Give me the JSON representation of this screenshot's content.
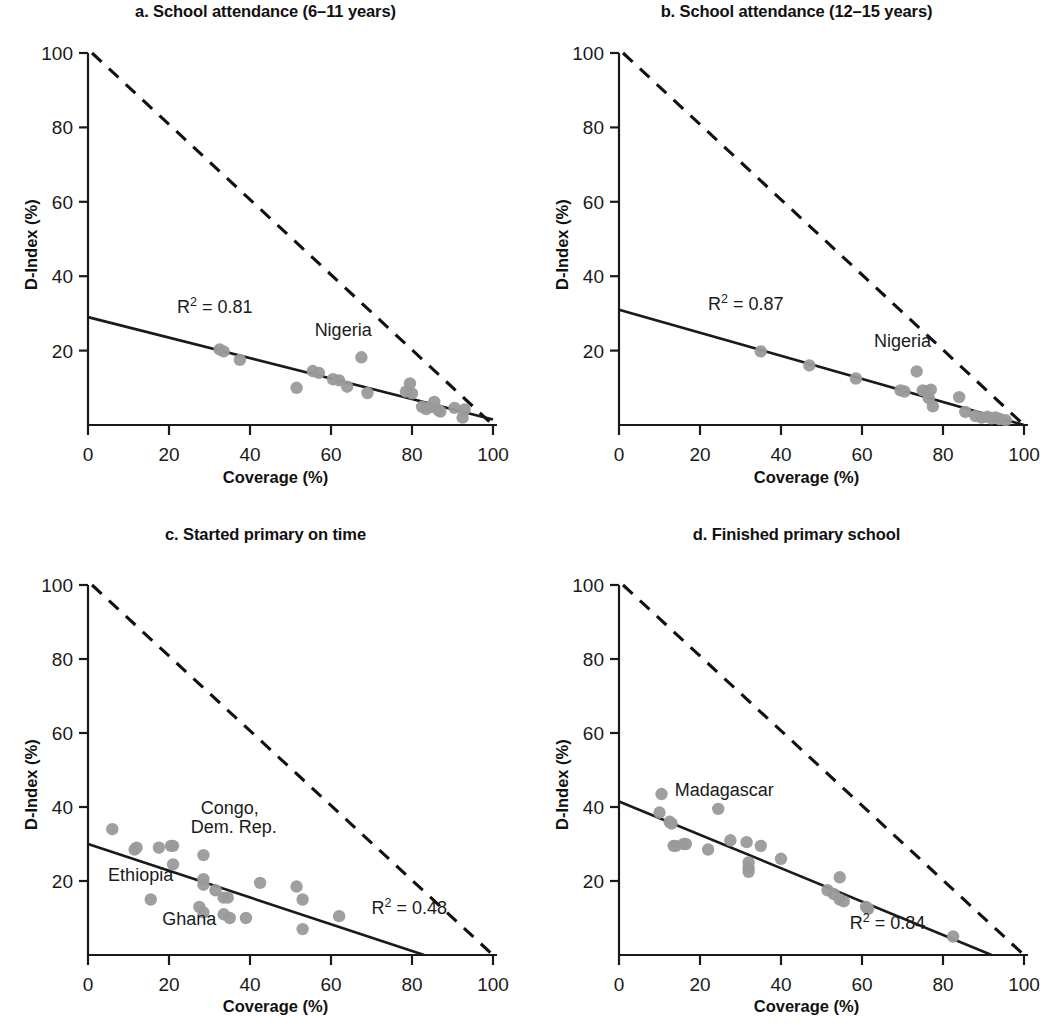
{
  "figure": {
    "axis_titles": {
      "x": "Coverage (%)",
      "y": "D-Index (%)"
    },
    "tick_labels_x": [
      "0",
      "20",
      "40",
      "60",
      "80",
      "100"
    ],
    "tick_labels_y": [
      "0",
      "20",
      "40",
      "60",
      "80",
      "100"
    ],
    "colors": {
      "dot": "#9a9a9a",
      "line": "#1a1a1a",
      "text": "#1a1a1a",
      "background": "#ffffff"
    }
  },
  "chart_data": [
    {
      "type": "scatter",
      "panel": "a",
      "title": "a. School attendance (6–11 years)",
      "xlabel": "Coverage (%)",
      "ylabel": "D-Index (%)",
      "xlim": [
        0,
        100
      ],
      "ylim": [
        0,
        100
      ],
      "xticks": [
        0,
        20,
        40,
        60,
        80,
        100
      ],
      "yticks": [
        0,
        20,
        40,
        60,
        80,
        100
      ],
      "grid": false,
      "legend": "none",
      "r2_label": "R² = 0.81",
      "r2_value": 0.81,
      "r2_pos": [
        22,
        30
      ],
      "fit_line": {
        "x": [
          0,
          100
        ],
        "y": [
          29,
          1.5
        ]
      },
      "max_line": {
        "x": [
          1,
          100
        ],
        "y": [
          100,
          0
        ],
        "style": "dashed"
      },
      "annotations": [
        {
          "text": "Nigeria",
          "x": 63,
          "y": 24
        }
      ],
      "points": [
        [
          32.5,
          20.3
        ],
        [
          33.5,
          19.8
        ],
        [
          37.5,
          17.5
        ],
        [
          51.5,
          10.0
        ],
        [
          55.5,
          14.5
        ],
        [
          57.0,
          14.0
        ],
        [
          60.5,
          12.3
        ],
        [
          62.0,
          12.0
        ],
        [
          64.0,
          10.3
        ],
        [
          67.5,
          18.2
        ],
        [
          69.0,
          8.6
        ],
        [
          78.5,
          9.0
        ],
        [
          79.5,
          11.2
        ],
        [
          80.0,
          8.5
        ],
        [
          82.5,
          4.9
        ],
        [
          83.5,
          4.3
        ],
        [
          84.5,
          4.8
        ],
        [
          85.5,
          6.2
        ],
        [
          86.5,
          4.0
        ],
        [
          87.0,
          3.6
        ],
        [
          90.5,
          4.6
        ],
        [
          92.5,
          2.0
        ],
        [
          93.0,
          4.2
        ]
      ]
    },
    {
      "type": "scatter",
      "panel": "b",
      "title": "b. School attendance (12–15 years)",
      "xlabel": "Coverage (%)",
      "ylabel": "D-Index (%)",
      "xlim": [
        0,
        100
      ],
      "ylim": [
        0,
        100
      ],
      "xticks": [
        0,
        20,
        40,
        60,
        80,
        100
      ],
      "yticks": [
        0,
        20,
        40,
        60,
        80,
        100
      ],
      "grid": false,
      "legend": "none",
      "r2_label": "R² = 0.87",
      "r2_value": 0.87,
      "r2_pos": [
        22,
        31
      ],
      "fit_line": {
        "x": [
          0,
          100
        ],
        "y": [
          31,
          0
        ]
      },
      "max_line": {
        "x": [
          1,
          100
        ],
        "y": [
          100,
          0
        ],
        "style": "dashed"
      },
      "annotations": [
        {
          "text": "Nigeria",
          "x": 70,
          "y": 21
        }
      ],
      "points": [
        [
          35.0,
          19.8
        ],
        [
          47.0,
          16.0
        ],
        [
          58.5,
          12.5
        ],
        [
          69.5,
          9.3
        ],
        [
          70.5,
          9.0
        ],
        [
          73.5,
          14.4
        ],
        [
          75.0,
          9.3
        ],
        [
          76.0,
          9.0
        ],
        [
          76.5,
          7.2
        ],
        [
          77.0,
          9.5
        ],
        [
          77.5,
          5.0
        ],
        [
          84.0,
          7.5
        ],
        [
          85.5,
          3.5
        ],
        [
          88.0,
          2.4
        ],
        [
          89.5,
          2.0
        ],
        [
          91.0,
          2.2
        ],
        [
          92.0,
          1.8
        ],
        [
          93.0,
          2.0
        ],
        [
          94.0,
          1.6
        ],
        [
          95.5,
          1.3
        ]
      ]
    },
    {
      "type": "scatter",
      "panel": "c",
      "title": "c. Started primary on time",
      "xlabel": "Coverage (%)",
      "ylabel": "D-Index (%)",
      "xlim": [
        0,
        100
      ],
      "ylim": [
        0,
        100
      ],
      "xticks": [
        0,
        20,
        40,
        60,
        80,
        100
      ],
      "yticks": [
        0,
        20,
        40,
        60,
        80,
        100
      ],
      "grid": false,
      "legend": "none",
      "r2_label": "R² = 0.48",
      "r2_value": 0.48,
      "r2_pos": [
        70,
        11
      ],
      "fit_line": {
        "x": [
          0,
          83
        ],
        "y": [
          30,
          0
        ]
      },
      "max_line": {
        "x": [
          1,
          100
        ],
        "y": [
          100,
          0
        ],
        "style": "dashed"
      },
      "annotations": [
        {
          "text": "Congo,",
          "x": 35,
          "y": 38
        },
        {
          "text": "Dem. Rep.",
          "x": 36,
          "y": 33
        },
        {
          "text": "Ethiopia",
          "x": 13,
          "y": 20
        },
        {
          "text": "Ghana",
          "x": 25,
          "y": 8
        }
      ],
      "points": [
        [
          6.0,
          34.0
        ],
        [
          11.5,
          28.5
        ],
        [
          12.0,
          29.0
        ],
        [
          17.5,
          29.0
        ],
        [
          20.5,
          29.5
        ],
        [
          21.0,
          29.5
        ],
        [
          21.0,
          24.5
        ],
        [
          15.5,
          15.0
        ],
        [
          28.5,
          27.0
        ],
        [
          28.5,
          20.5
        ],
        [
          28.5,
          19.0
        ],
        [
          27.5,
          13.0
        ],
        [
          28.5,
          11.5
        ],
        [
          31.5,
          17.5
        ],
        [
          33.5,
          15.5
        ],
        [
          34.5,
          15.5
        ],
        [
          33.5,
          11.0
        ],
        [
          35.0,
          10.0
        ],
        [
          39.0,
          10.0
        ],
        [
          42.5,
          19.5
        ],
        [
          51.5,
          18.5
        ],
        [
          53.0,
          15.0
        ],
        [
          53.0,
          7.0
        ],
        [
          62.0,
          10.5
        ]
      ]
    },
    {
      "type": "scatter",
      "panel": "d",
      "title": "d. Finished primary school",
      "xlabel": "Coverage (%)",
      "ylabel": "D-Index (%)",
      "xlim": [
        0,
        100
      ],
      "ylim": [
        0,
        100
      ],
      "xticks": [
        0,
        20,
        40,
        60,
        80,
        100
      ],
      "yticks": [
        0,
        20,
        40,
        60,
        80,
        100
      ],
      "grid": false,
      "legend": "none",
      "r2_label": "R² = 0.84",
      "r2_value": 0.84,
      "r2_pos": [
        57,
        7
      ],
      "fit_line": {
        "x": [
          0,
          92
        ],
        "y": [
          41.5,
          0
        ]
      },
      "max_line": {
        "x": [
          1,
          100
        ],
        "y": [
          100,
          0
        ],
        "style": "dashed"
      },
      "annotations": [
        {
          "text": "Madagascar",
          "x": 26,
          "y": 43
        }
      ],
      "points": [
        [
          10.5,
          43.5
        ],
        [
          10.0,
          38.5
        ],
        [
          12.5,
          36.0
        ],
        [
          13.0,
          35.5
        ],
        [
          13.5,
          29.5
        ],
        [
          14.0,
          29.5
        ],
        [
          16.0,
          30.0
        ],
        [
          16.5,
          30.0
        ],
        [
          22.0,
          28.5
        ],
        [
          24.5,
          39.5
        ],
        [
          27.5,
          31.0
        ],
        [
          31.5,
          30.5
        ],
        [
          32.0,
          25.0
        ],
        [
          32.0,
          23.5
        ],
        [
          32.0,
          22.5
        ],
        [
          35.0,
          29.5
        ],
        [
          40.0,
          26.0
        ],
        [
          51.5,
          17.5
        ],
        [
          53.0,
          16.5
        ],
        [
          54.5,
          21.0
        ],
        [
          54.5,
          15.0
        ],
        [
          55.5,
          14.5
        ],
        [
          61.0,
          13.0
        ],
        [
          61.5,
          12.5
        ],
        [
          82.5,
          5.0
        ]
      ]
    }
  ]
}
